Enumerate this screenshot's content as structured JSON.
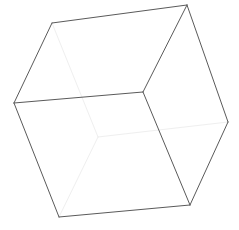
{
  "figure": {
    "background_color": "#ffffff",
    "canvas": {
      "width": 239,
      "height": 230
    }
  },
  "chart_data": {
    "type": "diagram",
    "subtype": "wireframe-cube",
    "xlabel": "",
    "ylabel": "",
    "grid": false,
    "legend": false,
    "xlim": [
      0,
      239
    ],
    "ylim": [
      0,
      230
    ],
    "colors": {
      "visible_edge": "#5a5a5a",
      "hidden_edge": "#efefef",
      "background": "#ffffff"
    },
    "stroke_widths": {
      "visible_edge": 1.0,
      "hidden_edge": 1.0
    },
    "vertices": [
      {
        "id": "top-back-left",
        "x": 52,
        "y": 23,
        "hidden": false
      },
      {
        "id": "top-back-right",
        "x": 187,
        "y": 5,
        "hidden": false
      },
      {
        "id": "top-front-right",
        "x": 143,
        "y": 92,
        "hidden": false
      },
      {
        "id": "top-front-left",
        "x": 14,
        "y": 103,
        "hidden": false
      },
      {
        "id": "bottom-back-left",
        "x": 98,
        "y": 137,
        "hidden": true
      },
      {
        "id": "bottom-back-right",
        "x": 228,
        "y": 122,
        "hidden": false
      },
      {
        "id": "bottom-front-right",
        "x": 190,
        "y": 205,
        "hidden": false
      },
      {
        "id": "bottom-front-left",
        "x": 59,
        "y": 217,
        "hidden": false
      }
    ],
    "edges": [
      {
        "id": "top-back",
        "from": "top-back-left",
        "to": "top-back-right",
        "x1": 52,
        "y1": 23,
        "x2": 187,
        "y2": 5,
        "style": "visible",
        "color": "#5a5a5a"
      },
      {
        "id": "top-right",
        "from": "top-back-right",
        "to": "top-front-right",
        "x1": 187,
        "y1": 5,
        "x2": 143,
        "y2": 92,
        "style": "visible",
        "color": "#5a5a5a"
      },
      {
        "id": "top-front",
        "from": "top-front-right",
        "to": "top-front-left",
        "x1": 143,
        "y1": 92,
        "x2": 14,
        "y2": 103,
        "style": "visible",
        "color": "#5a5a5a"
      },
      {
        "id": "top-left",
        "from": "top-front-left",
        "to": "top-back-left",
        "x1": 14,
        "y1": 103,
        "x2": 52,
        "y2": 23,
        "style": "visible",
        "color": "#5a5a5a"
      },
      {
        "id": "vertical-front-left",
        "from": "top-front-left",
        "to": "bottom-front-left",
        "x1": 14,
        "y1": 103,
        "x2": 59,
        "y2": 217,
        "style": "visible",
        "color": "#5a5a5a"
      },
      {
        "id": "vertical-front-right",
        "from": "top-front-right",
        "to": "bottom-front-right",
        "x1": 143,
        "y1": 92,
        "x2": 190,
        "y2": 205,
        "style": "visible",
        "color": "#5a5a5a"
      },
      {
        "id": "vertical-back-right",
        "from": "top-back-right",
        "to": "bottom-back-right",
        "x1": 187,
        "y1": 5,
        "x2": 228,
        "y2": 122,
        "style": "visible",
        "color": "#5a5a5a"
      },
      {
        "id": "bottom-front",
        "from": "bottom-front-left",
        "to": "bottom-front-right",
        "x1": 59,
        "y1": 217,
        "x2": 190,
        "y2": 205,
        "style": "visible",
        "color": "#5a5a5a"
      },
      {
        "id": "bottom-right",
        "from": "bottom-front-right",
        "to": "bottom-back-right",
        "x1": 190,
        "y1": 205,
        "x2": 228,
        "y2": 122,
        "style": "visible",
        "color": "#5a5a5a"
      },
      {
        "id": "vertical-back-left",
        "from": "top-back-left",
        "to": "bottom-back-left",
        "x1": 52,
        "y1": 23,
        "x2": 98,
        "y2": 137,
        "style": "hidden",
        "color": "#efefef"
      },
      {
        "id": "bottom-back",
        "from": "bottom-back-left",
        "to": "bottom-back-right",
        "x1": 98,
        "y1": 137,
        "x2": 228,
        "y2": 122,
        "style": "hidden",
        "color": "#efefef"
      },
      {
        "id": "bottom-left",
        "from": "bottom-back-left",
        "to": "bottom-front-left",
        "x1": 98,
        "y1": 137,
        "x2": 59,
        "y2": 217,
        "style": "hidden",
        "color": "#efefef"
      }
    ]
  }
}
